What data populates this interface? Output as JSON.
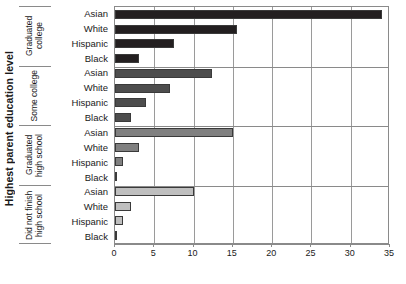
{
  "chart_data": {
    "type": "bar",
    "orientation": "horizontal",
    "title": "",
    "xlabel": "",
    "ylabel": "Highest parent education level",
    "xlim": [
      0,
      35
    ],
    "xticks": [
      0,
      5,
      10,
      15,
      20,
      25,
      30,
      35
    ],
    "grid": true,
    "legend": "none",
    "categories": [
      "Asian",
      "White",
      "Hispanic",
      "Black"
    ],
    "groups": [
      {
        "name": "Graduated college",
        "color": "#231f20",
        "values": [
          34.0,
          15.5,
          7.5,
          3.0
        ]
      },
      {
        "name": "Some college",
        "color": "#4d4d4d",
        "values": [
          12.3,
          7.0,
          4.0,
          2.0
        ]
      },
      {
        "name": "Graduated high school",
        "color": "#808080",
        "values": [
          15.0,
          3.0,
          1.0,
          0.2
        ]
      },
      {
        "name": "Did not finish high school",
        "color": "#bfbfbf",
        "values": [
          10.0,
          2.0,
          1.0,
          0.2
        ]
      }
    ]
  },
  "axis": {
    "y_title": "Highest parent education level"
  }
}
